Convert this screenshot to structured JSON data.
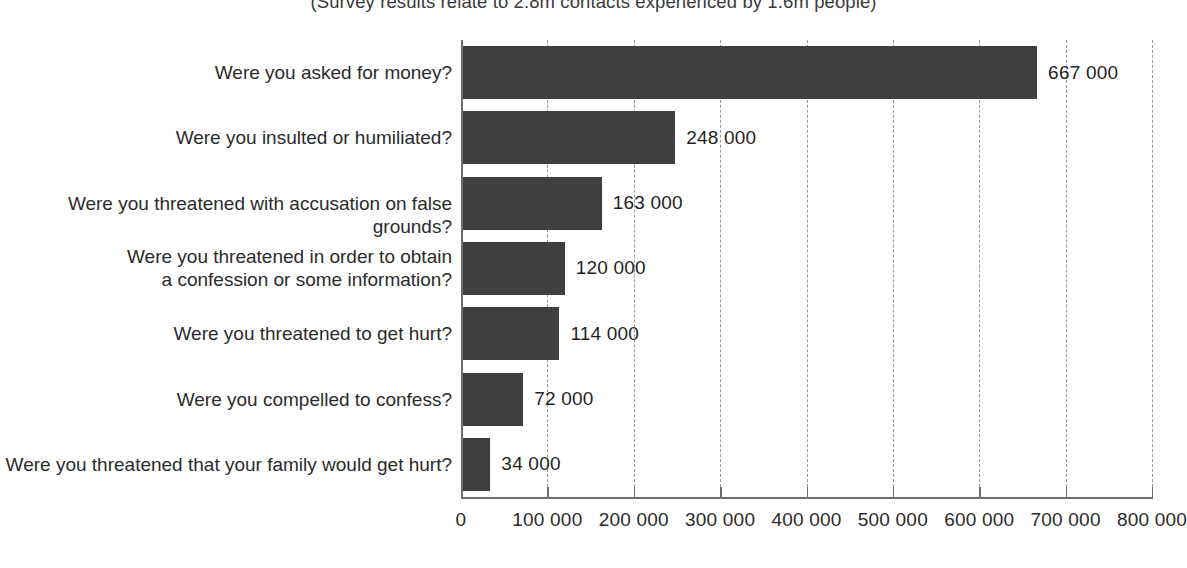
{
  "subtitle": "(Survey results relate to 2.8m contacts experienced by 1.6m people)",
  "footer_note": "",
  "colors": {
    "bar": "#3f3f3f",
    "axis": "#6e6e6e",
    "gridline": "#9a9a9a",
    "text": "#2b2b2b",
    "background": "#ffffff"
  },
  "chart_data": {
    "type": "bar",
    "orientation": "horizontal",
    "title": "",
    "subtitle": "(Survey results relate to 2.8m contacts experienced by 1.6m people)",
    "xlabel": "",
    "ylabel": "",
    "xlim": [
      0,
      800000
    ],
    "grid": true,
    "grid_axis": "x",
    "grid_style": "dashed",
    "legend": false,
    "legend_position": "none",
    "categories": [
      "Were you asked for money?",
      "Were you insulted or humiliated?",
      "Were you threatened with accusation on false grounds?",
      "Were you threatened in order to obtain\na confession or some information?",
      "Were you threatened to get hurt?",
      "Were you compelled to confess?",
      "Were you threatened that your family would get hurt?"
    ],
    "values": [
      667000,
      248000,
      163000,
      120000,
      114000,
      72000,
      34000
    ],
    "value_labels": [
      "667 000",
      "248 000",
      "163 000",
      "120 000",
      "114 000",
      "72 000",
      "34 000"
    ],
    "xticks": [
      0,
      100000,
      200000,
      300000,
      400000,
      500000,
      600000,
      700000,
      800000
    ],
    "xticklabels": [
      "0",
      "100 000",
      "200 000",
      "300 000",
      "400 000",
      "500 000",
      "600 000",
      "700 000",
      "800 000"
    ]
  }
}
